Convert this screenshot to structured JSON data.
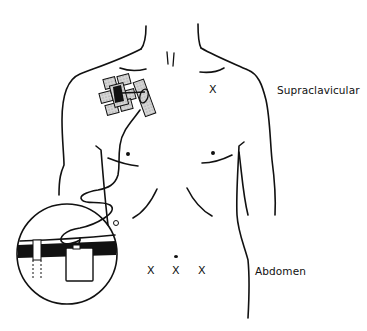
{
  "figure": {
    "labels": {
      "supraclavicular": "Supraclavicular",
      "abdomen": "Abdomen"
    },
    "site_marks": {
      "supraclavicular": [
        "X"
      ],
      "abdomen": [
        "X",
        "X",
        "X"
      ]
    },
    "colors": {
      "line": "#111111",
      "patch_fill": "#bdbdbd",
      "background": "#ffffff"
    }
  }
}
